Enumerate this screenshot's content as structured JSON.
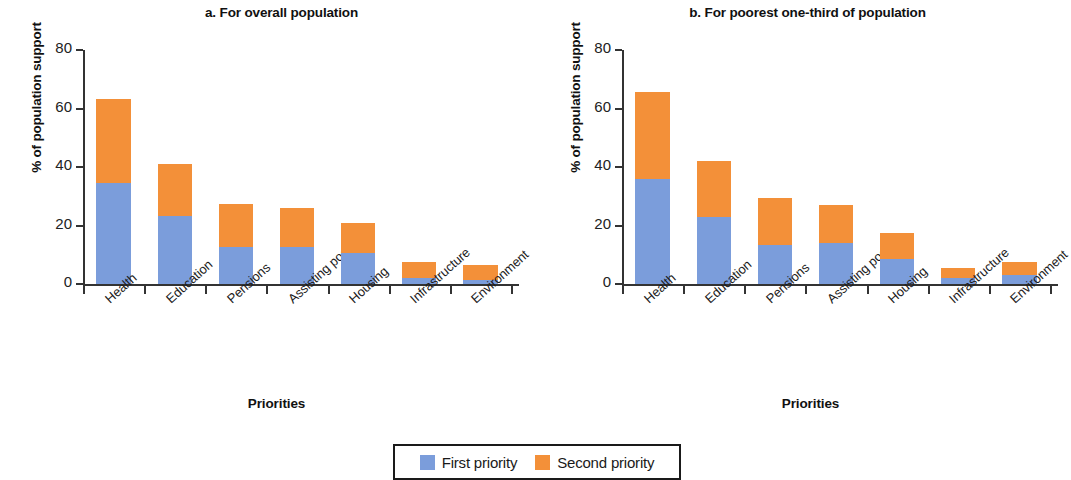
{
  "figure": {
    "legend": {
      "entries": [
        {
          "label": "First priority",
          "color": "#7b9ddb",
          "icon": "blue-square-swatch"
        },
        {
          "label": "Second priority",
          "color": "#f39039",
          "icon": "orange-square-swatch"
        }
      ]
    }
  },
  "chart_data": [
    {
      "type": "bar",
      "id": "panel-a",
      "title": "a. For overall population",
      "xlabel": "Priorities",
      "ylabel": "% of population support",
      "ylim": [
        0,
        80
      ],
      "yticks": [
        0,
        20,
        40,
        60,
        80
      ],
      "ytick_labels": [
        "0",
        "20",
        "40",
        "60",
        "80"
      ],
      "grid": false,
      "stacked": true,
      "legend_position": "bottom-center-shared",
      "categories": [
        "Health",
        "Education",
        "Pensions",
        "Assisting poor",
        "Housing",
        "Infrastructure",
        "Environment"
      ],
      "series": [
        {
          "name": "First priority",
          "color": "#7b9ddb",
          "values": [
            34.5,
            23.3,
            12.5,
            12.5,
            10.5,
            2.0,
            1.5
          ]
        },
        {
          "name": "Second priority",
          "color": "#f39039",
          "values": [
            28.8,
            17.9,
            14.8,
            13.5,
            10.5,
            5.5,
            5.0
          ]
        }
      ],
      "totals": [
        63.3,
        41.2,
        27.3,
        26.0,
        21.0,
        7.5,
        6.5
      ]
    },
    {
      "type": "bar",
      "id": "panel-b",
      "title": "b. For poorest  one-third of population",
      "xlabel": "Priorities",
      "ylabel": "% of population support",
      "ylim": [
        0,
        80
      ],
      "yticks": [
        0,
        20,
        40,
        60,
        80
      ],
      "ytick_labels": [
        "0",
        "20",
        "40",
        "60",
        "80"
      ],
      "grid": false,
      "stacked": true,
      "legend_position": "bottom-center-shared",
      "categories": [
        "Health",
        "Education",
        "Pensions",
        "Assisting poor",
        "Housing",
        "Infrastructure",
        "Environment"
      ],
      "series": [
        {
          "name": "First priority",
          "color": "#7b9ddb",
          "values": [
            36.0,
            23.0,
            13.5,
            14.0,
            8.5,
            2.0,
            3.0
          ]
        },
        {
          "name": "Second priority",
          "color": "#f39039",
          "values": [
            29.5,
            19.0,
            16.0,
            13.0,
            9.0,
            3.5,
            4.5
          ]
        }
      ],
      "totals": [
        65.5,
        42.0,
        29.5,
        27.0,
        17.5,
        5.5,
        7.5
      ]
    }
  ]
}
